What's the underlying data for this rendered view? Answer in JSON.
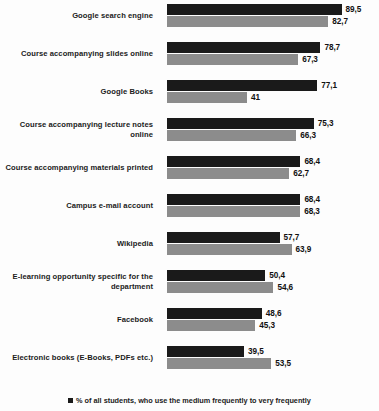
{
  "chart_data": {
    "type": "bar",
    "orientation": "horizontal",
    "title": "",
    "subtitle": "",
    "xlabel": "",
    "ylabel": "",
    "xlim": [
      0,
      100
    ],
    "grid": false,
    "legend_position": "bottom",
    "decimal_separator": ",",
    "categories": [
      "Google search engine",
      "Course accompanying slides online",
      "Google Books",
      "Course accompanying lecture notes online",
      "Course accompanying materials printed",
      "Campus e-mail account",
      "Wikipedia",
      "E-learning opportunity specific for the department",
      "Facebook",
      "Electronic books (E-Books, PDFs etc.)"
    ],
    "series": [
      {
        "name": "% of all students, who use the medium frequently to very frequently",
        "color": "#1a1a1a",
        "values": [
          89.5,
          78.7,
          77.1,
          75.3,
          68.4,
          68.4,
          57.7,
          50.4,
          48.6,
          39.5
        ],
        "labels": [
          "89,5",
          "78,7",
          "77,1",
          "75,3",
          "68,4",
          "68,4",
          "57,7",
          "50,4",
          "48,6",
          "39,5"
        ]
      },
      {
        "name": "% of students of the department, who use the medium frequently to very frequently",
        "color": "#8c8c8c",
        "values": [
          82.7,
          67.3,
          41.0,
          66.3,
          62.7,
          68.3,
          63.9,
          54.6,
          45.3,
          53.5
        ],
        "labels": [
          "82,7",
          "67,3",
          "41",
          "66,3",
          "62,7",
          "68,3",
          "63,9",
          "54,6",
          "45,3",
          "53,5"
        ]
      }
    ],
    "legend": [
      "% of all students, who use the medium frequently to very frequently"
    ]
  }
}
